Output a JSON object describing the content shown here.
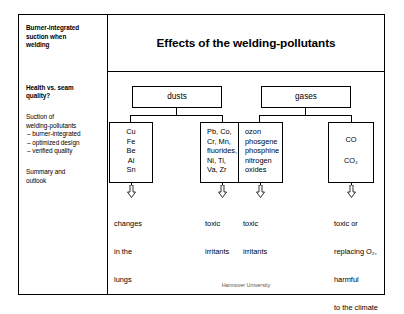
{
  "slide": {
    "title": "Effects of the welding-pollutants",
    "footer": "Hannover University"
  },
  "sidebar": {
    "items": [
      {
        "id": "burner-integrated-suction",
        "bold": true,
        "lines": [
          "Burner-integrated",
          "suction when",
          "welding"
        ]
      },
      {
        "id": "health-vs-seam-quality",
        "bold": true,
        "lines": [
          "Health vs. seam",
          "quality?"
        ]
      },
      {
        "id": "suction-of-welding-pollutants",
        "bold": false,
        "lines": [
          "Suction of",
          "welding-pollutants"
        ],
        "bullets": [
          "– burner-integrated",
          "– optimized design",
          "– verified quality"
        ]
      },
      {
        "id": "summary-and-outlook",
        "bold": false,
        "lines": [
          "Summary and",
          "outlook"
        ]
      }
    ]
  },
  "diagram": {
    "groups": [
      {
        "id": "dusts",
        "label": "dusts"
      },
      {
        "id": "gases",
        "label": "gases"
      }
    ],
    "categories": [
      {
        "id": "dust-metals",
        "group": "dusts",
        "align": "center",
        "items": [
          "Cu",
          "Fe",
          "Be",
          "Al",
          "Sn"
        ],
        "effect": [
          "changes",
          "in the",
          "lungs"
        ]
      },
      {
        "id": "dust-compounds",
        "group": "dusts",
        "align": "left",
        "items": [
          "Pb, Co,",
          "Cr, Mn,",
          "fluorides,",
          "Ni, Ti,",
          "Va, Zr"
        ],
        "effect": [
          "toxic",
          "irritants"
        ]
      },
      {
        "id": "gas-toxic",
        "group": "gases",
        "align": "left",
        "items": [
          "ozon",
          "phosgene",
          "phosphine",
          "nitrogen",
          "oxides"
        ],
        "effect": [
          "toxic",
          "irritants"
        ]
      },
      {
        "id": "gas-carbon-oxides",
        "group": "gases",
        "align": "center",
        "items": [
          "CO",
          "CO₂"
        ],
        "effect": [
          "toxic or",
          "replacing O₂,",
          "harmful",
          "to the climate"
        ]
      }
    ]
  }
}
